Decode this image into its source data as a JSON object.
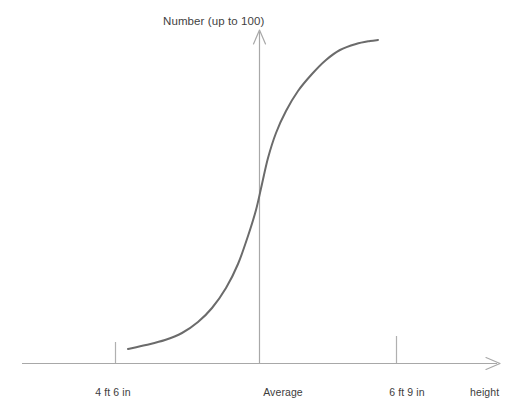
{
  "chart_data": {
    "type": "line",
    "title": "Number (up to 100)",
    "xlabel": "height",
    "ylabel": "Number (up to 100)",
    "grid": false,
    "legend": null,
    "axis_arrows": {
      "x": true,
      "y": true
    },
    "x_tick_labels": [
      "4 ft 6 in",
      "Average",
      "6 ft 9 in"
    ],
    "x_tick_positions_px": [
      115,
      259,
      396
    ],
    "x_axis_range_px": [
      22,
      500
    ],
    "y_axis_range_px": [
      363,
      30
    ],
    "series": [
      {
        "name": "cumulative-height-distribution",
        "shape": "sigmoid-ogive",
        "points_px": [
          [
            128,
            349
          ],
          [
            146,
            345
          ],
          [
            165,
            340
          ],
          [
            182,
            333
          ],
          [
            198,
            322
          ],
          [
            212,
            308
          ],
          [
            226,
            288
          ],
          [
            238,
            264
          ],
          [
            248,
            236
          ],
          [
            256,
            210
          ],
          [
            262,
            184
          ],
          [
            268,
            158
          ],
          [
            276,
            133
          ],
          [
            286,
            111
          ],
          [
            298,
            91
          ],
          [
            312,
            74
          ],
          [
            326,
            60
          ],
          [
            340,
            50
          ],
          [
            356,
            44
          ],
          [
            370,
            41
          ],
          [
            378,
            40
          ]
        ]
      }
    ]
  },
  "style": {
    "curve_color": "#6b6b6b",
    "axis_color": "#a8a8a8",
    "tick_color": "#b0b0b0",
    "text_color": "#3d3d3d",
    "background": "#ffffff"
  }
}
